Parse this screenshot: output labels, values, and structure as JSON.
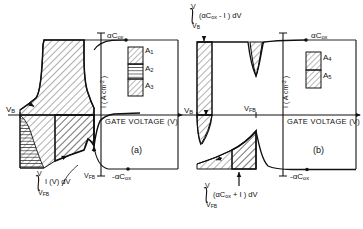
{
  "figure": {
    "axis": {
      "xlabel": "GATE VOLTAGE (V)",
      "ylabel_main": "I ( A cm",
      "ylabel_exp": "-2",
      "ylabel_tail": " )"
    },
    "panels": [
      {
        "id": "a",
        "caption": "(a)",
        "top_level_label": "αC",
        "top_level_sub": "ox",
        "bottom_level_label": "-αC",
        "bottom_level_sub": "ox",
        "vb_label": "V",
        "vb_sub": "B",
        "vfb_label": "V",
        "vfb_sub": "FB",
        "integral_upper": "V",
        "integral_lower": "V",
        "integral_lower_sub": "FB",
        "integral_body": "I (V) dV",
        "legend": [
          {
            "name": "A",
            "sub": "1",
            "pattern": "diagonal"
          },
          {
            "name": "A",
            "sub": "2",
            "pattern": "horizontal"
          },
          {
            "name": "A",
            "sub": "3",
            "pattern": "diagonal"
          }
        ]
      },
      {
        "id": "b",
        "caption": "(b)",
        "top_level_label": "αC",
        "top_level_sub": "ox",
        "bottom_level_label": "-αC",
        "bottom_level_sub": "ox",
        "vb_label": "V",
        "vb_sub": "B",
        "vfb_label": "V",
        "vfb_sub": "FB",
        "integral_top_upper": "V",
        "integral_top_lower": "V",
        "integral_top_lower_sub": "B",
        "integral_top_body": "(αC",
        "integral_top_body_sub": "ox",
        "integral_top_body_tail": " - I ) dV",
        "integral_bot_upper": "V",
        "integral_bot_lower": "V",
        "integral_bot_lower_sub": "FB",
        "integral_bot_body": "(αC",
        "integral_bot_body_sub": "ox",
        "integral_bot_body_tail": " + I ) dV",
        "legend": [
          {
            "name": "A",
            "sub": "4",
            "pattern": "diagonal"
          },
          {
            "name": "A",
            "sub": "5",
            "pattern": "diagonal"
          }
        ]
      }
    ],
    "colors": {
      "ink": "#111111",
      "hatch": "#333333",
      "background": "#ffffff"
    }
  }
}
